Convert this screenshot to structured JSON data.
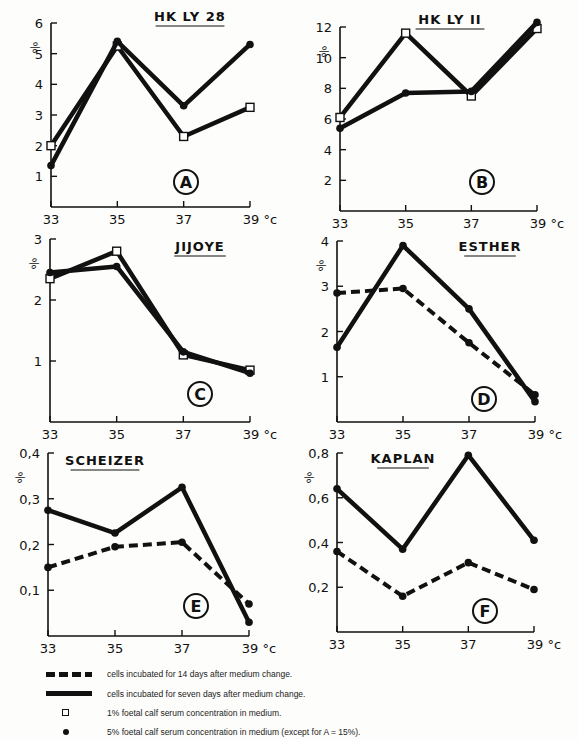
{
  "legend": {
    "dashed": "cells incubated for 14 days after medium change.",
    "solid": "cells incubated for seven days after medium change.",
    "square": "1% foetal calf serum concentration in medium.",
    "dot": "5% foetal calf serum concentration in medium (except for A = 15%)."
  },
  "chart_data": [
    {
      "panel": "A",
      "type": "line",
      "title": "HK LY 28",
      "xlabel": "°c",
      "ylabel": "%",
      "x": [
        33,
        35,
        37,
        39
      ],
      "x_ticks": [
        "33",
        "35",
        "37",
        "39 °c"
      ],
      "y_ticks": [
        "1",
        "2",
        "3",
        "4",
        "5",
        "6"
      ],
      "ylim": [
        0,
        6
      ],
      "series": [
        {
          "name": "1% serum, 7 days",
          "style": "solid",
          "marker": "square",
          "values": [
            2.0,
            5.25,
            2.3,
            3.25
          ]
        },
        {
          "name": "15% serum, 7 days",
          "style": "solid",
          "marker": "dot",
          "values": [
            1.35,
            5.4,
            3.3,
            5.3
          ]
        }
      ]
    },
    {
      "panel": "B",
      "type": "line",
      "title": "HK LY II",
      "xlabel": "°c",
      "ylabel": "%",
      "x": [
        33,
        35,
        37,
        39
      ],
      "x_ticks": [
        "33",
        "35",
        "37",
        "39 °c"
      ],
      "y_ticks": [
        "2",
        "4",
        "6",
        "8",
        "10",
        "12"
      ],
      "ylim": [
        0,
        12
      ],
      "series": [
        {
          "name": "1% serum, 7 days",
          "style": "solid",
          "marker": "square",
          "values": [
            6.1,
            11.6,
            7.5,
            11.9
          ]
        },
        {
          "name": "5% serum, 7 days",
          "style": "solid",
          "marker": "dot",
          "values": [
            5.4,
            7.7,
            7.8,
            12.3
          ]
        }
      ]
    },
    {
      "panel": "C",
      "type": "line",
      "title": "JIJOYE",
      "xlabel": "°c",
      "ylabel": "%",
      "x": [
        33,
        35,
        37,
        39
      ],
      "x_ticks": [
        "33",
        "35",
        "37",
        "39 °c"
      ],
      "y_ticks": [
        "1",
        "2",
        "3"
      ],
      "ylim": [
        0,
        3
      ],
      "series": [
        {
          "name": "1% serum, 7 days",
          "style": "solid",
          "marker": "square",
          "values": [
            2.35,
            2.8,
            1.1,
            0.85
          ]
        },
        {
          "name": "5% serum, 7 days",
          "style": "solid",
          "marker": "dot",
          "values": [
            2.45,
            2.55,
            1.15,
            0.8
          ]
        }
      ]
    },
    {
      "panel": "D",
      "type": "line",
      "title": "ESTHER",
      "xlabel": "°c",
      "ylabel": "%",
      "x": [
        33,
        35,
        37,
        39
      ],
      "x_ticks": [
        "33",
        "35",
        "37",
        "39 °c"
      ],
      "y_ticks": [
        "1",
        "2",
        "3",
        "4"
      ],
      "ylim": [
        0,
        4
      ],
      "series": [
        {
          "name": "5% serum, 14 days",
          "style": "dashed",
          "marker": "dot",
          "values": [
            2.85,
            2.95,
            1.75,
            0.6
          ]
        },
        {
          "name": "5% serum, 7 days",
          "style": "solid",
          "marker": "dot",
          "values": [
            1.65,
            3.9,
            2.5,
            0.45
          ]
        }
      ]
    },
    {
      "panel": "E",
      "type": "line",
      "title": "SCHEIZER",
      "xlabel": "°c",
      "ylabel": "%",
      "x": [
        33,
        35,
        37,
        39
      ],
      "x_ticks": [
        "33",
        "35",
        "37",
        "39 °c"
      ],
      "y_ticks": [
        "0,1",
        "0,2",
        "0,3",
        "0,4"
      ],
      "ylim": [
        0,
        0.4
      ],
      "series": [
        {
          "name": "5% serum, 14 days",
          "style": "dashed",
          "marker": "dot",
          "values": [
            0.15,
            0.195,
            0.205,
            0.07
          ]
        },
        {
          "name": "5% serum, 7 days",
          "style": "solid",
          "marker": "dot",
          "values": [
            0.275,
            0.225,
            0.325,
            0.03
          ]
        }
      ]
    },
    {
      "panel": "F",
      "type": "line",
      "title": "KAPLAN",
      "xlabel": "°c",
      "ylabel": "%",
      "x": [
        33,
        35,
        37,
        39
      ],
      "x_ticks": [
        "33",
        "35",
        "37",
        "39 °c"
      ],
      "y_ticks": [
        "0,2",
        "0,4",
        "0,6",
        "0,8"
      ],
      "ylim": [
        0,
        0.8
      ],
      "series": [
        {
          "name": "5% serum, 14 days",
          "style": "dashed",
          "marker": "dot",
          "values": [
            0.36,
            0.16,
            0.31,
            0.19
          ]
        },
        {
          "name": "5% serum, 7 days",
          "style": "solid",
          "marker": "dot",
          "values": [
            0.64,
            0.37,
            0.79,
            0.41
          ]
        }
      ]
    }
  ]
}
